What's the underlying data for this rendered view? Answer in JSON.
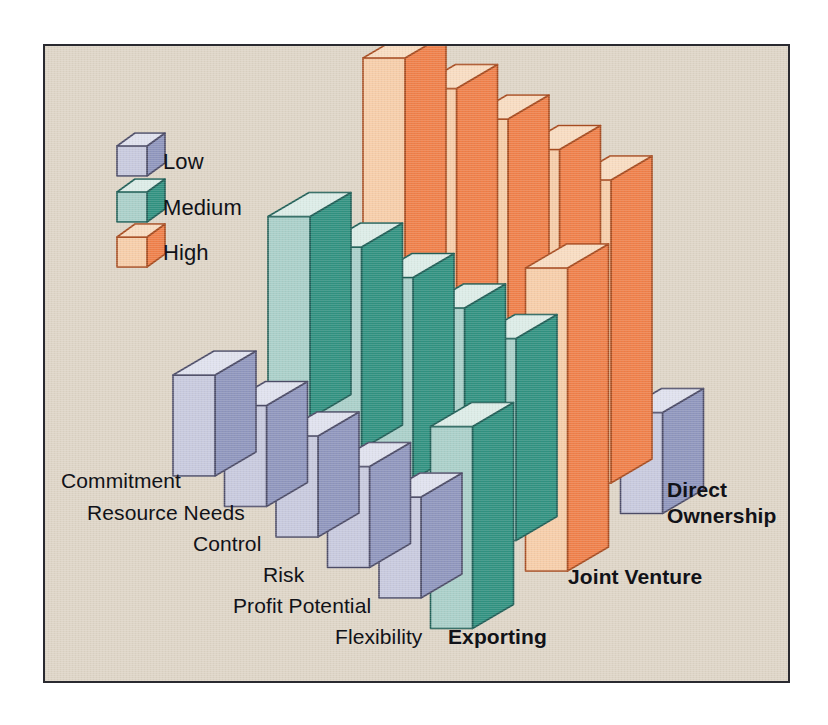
{
  "figure": {
    "background_color": "#ded5c7",
    "frame_border_color": "#2a2a30",
    "page_background": "#ffffff"
  },
  "legend": {
    "title": "",
    "position": "top-left",
    "items": [
      {
        "label": "Low",
        "key": "low",
        "front": "#c7c9de",
        "side": "#8e95bd",
        "top": "#dfe1ee",
        "edge": "#4a4a66"
      },
      {
        "label": "Medium",
        "key": "medium",
        "front": "#a9cfc9",
        "side": "#2f9180",
        "top": "#dcece7",
        "edge": "#1d5d55"
      },
      {
        "label": "High",
        "key": "high",
        "front": "#f6cda9",
        "side": "#ef7f49",
        "top": "#f8dcc1",
        "edge": "#a64a1e"
      }
    ]
  },
  "axes": {
    "attributes_label": "",
    "modes_label": "",
    "attributes": [
      "Commitment",
      "Resource Needs",
      "Control",
      "Risk",
      "Profit Potential",
      "Flexibility"
    ],
    "modes": [
      "Exporting",
      "Joint Venture",
      "Direct Ownership"
    ]
  },
  "chart_data": {
    "type": "bar",
    "title": "",
    "subtitle": "",
    "xlabel": "",
    "ylabel": "",
    "zlabel": "",
    "projection": "isometric-3d",
    "value_scale": {
      "Low": 1,
      "Medium": 2,
      "High": 3
    },
    "grid": false,
    "legend_position": "top-left",
    "categories": [
      "Commitment",
      "Resource Needs",
      "Control",
      "Risk",
      "Profit Potential",
      "Flexibility"
    ],
    "series": [
      {
        "name": "Exporting",
        "values": [
          "Low",
          "Low",
          "Low",
          "Low",
          "Low",
          "Medium"
        ],
        "numeric": [
          1,
          1,
          1,
          1,
          1,
          2
        ]
      },
      {
        "name": "Joint Venture",
        "values": [
          "Medium",
          "Medium",
          "Medium",
          "Medium",
          "Medium",
          "High"
        ],
        "numeric": [
          2,
          2,
          2,
          2,
          2,
          3
        ]
      },
      {
        "name": "Direct Ownership",
        "values": [
          "High",
          "High",
          "High",
          "High",
          "High",
          "Low"
        ],
        "numeric": [
          3,
          3,
          3,
          3,
          3,
          1
        ]
      }
    ],
    "annotations": []
  }
}
